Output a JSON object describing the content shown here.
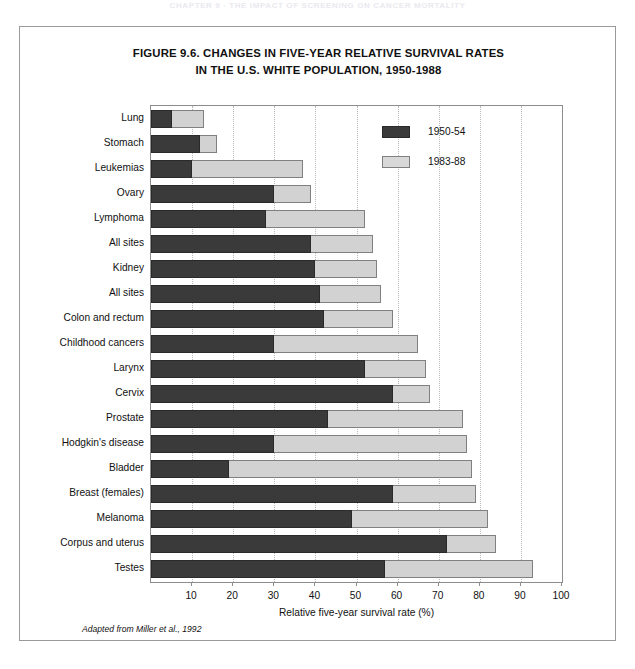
{
  "page": {
    "running_header": "CHAPTER 9 · THE IMPACT OF SCREENING ON CANCER MORTALITY"
  },
  "figure": {
    "title_line1": "FIGURE 9.6.  CHANGES IN FIVE-YEAR RELATIVE SURVIVAL RATES",
    "title_line2": "IN THE U.S. WHITE POPULATION, 1950-1988",
    "source_note": "Adapted from Miller et al., 1992"
  },
  "legend": {
    "position": "inside-top-right",
    "items": [
      {
        "label": "1950-54",
        "color": "#3a3a3a",
        "key": "early"
      },
      {
        "label": "1983-88",
        "color": "#d8d8d8",
        "key": "late"
      }
    ]
  },
  "axis": {
    "x_title": "Relative five-year survival rate (%)",
    "ticks": [
      10,
      20,
      30,
      40,
      50,
      60,
      70,
      80,
      90,
      100
    ],
    "tick_labels": [
      "10",
      "20",
      "30",
      "40",
      "50",
      "60",
      "70",
      "80",
      "90",
      "100"
    ],
    "min": 0,
    "max": 100
  },
  "chart_data": {
    "type": "bar",
    "orientation": "horizontal",
    "title": "FIGURE 9.6. CHANGES IN FIVE-YEAR RELATIVE SURVIVAL RATES IN THE U.S. WHITE POPULATION, 1950-1988",
    "xlabel": "Relative five-year survival rate (%)",
    "ylabel": "",
    "xlim": [
      0,
      100
    ],
    "grid": true,
    "grid_axis": "x",
    "legend": [
      "1950-54",
      "1983-88"
    ],
    "note": "Overlaid horizontal bars: each category draws the 1983-88 bar full length with the 1950-54 bar overlaid from the origin.",
    "categories": [
      "Lung",
      "Stomach",
      "Leukemias",
      "Ovary",
      "Lymphoma",
      "All sites",
      "Kidney",
      "All sites",
      "Colon and rectum",
      "Childhood cancers",
      "Larynx",
      "Cervix",
      "Prostate",
      "Hodgkin's disease",
      "Bladder",
      "Breast (females)",
      "Melanoma",
      "Corpus and uterus",
      "Testes"
    ],
    "series": [
      {
        "name": "1950-54",
        "color": "#3a3a3a",
        "values": [
          5,
          12,
          10,
          30,
          28,
          39,
          40,
          41,
          42,
          30,
          52,
          59,
          43,
          30,
          19,
          59,
          49,
          72,
          57
        ]
      },
      {
        "name": "1983-88",
        "color": "#d8d8d8",
        "values": [
          13,
          16,
          37,
          39,
          52,
          54,
          55,
          56,
          59,
          65,
          67,
          68,
          76,
          77,
          78,
          79,
          82,
          84,
          93
        ]
      }
    ]
  }
}
